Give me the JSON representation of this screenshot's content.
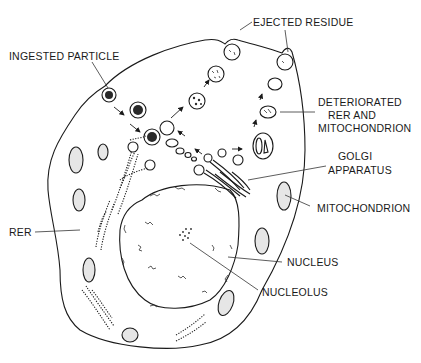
{
  "diagram": {
    "labels": {
      "ingested_particle": "INGESTED PARTICLE",
      "ejected_residue": "EJECTED RESIDUE",
      "deteriorated_line1": "DETERIORATED",
      "deteriorated_line2": "RER AND",
      "deteriorated_line3": "MITOCHONDRION",
      "golgi_line1": "GOLGI",
      "golgi_line2": "APPARATUS",
      "mitochondrion": "MITOCHONDRION",
      "rer": "RER",
      "nucleus": "NUCLEUS",
      "nucleolus": "NUCLEOLUS"
    },
    "colors": {
      "line": "#1a1a1a",
      "mitochondrion_fill": "#e6e6e6",
      "background": "#ffffff"
    }
  }
}
